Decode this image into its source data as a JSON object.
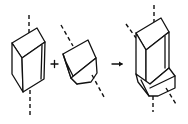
{
  "diagram": {
    "operators": {
      "plus": "+",
      "arrow": "→"
    },
    "colors": {
      "stroke": "#111111",
      "background": "#ffffff"
    },
    "parts": [
      {
        "name": "prism-crystal",
        "axis": "vertical dashed"
      },
      {
        "name": "tilted-block",
        "axis": "diagonal dashed"
      },
      {
        "name": "twinned-result",
        "axes": [
          "vertical dashed",
          "diagonal dashed"
        ]
      }
    ]
  }
}
